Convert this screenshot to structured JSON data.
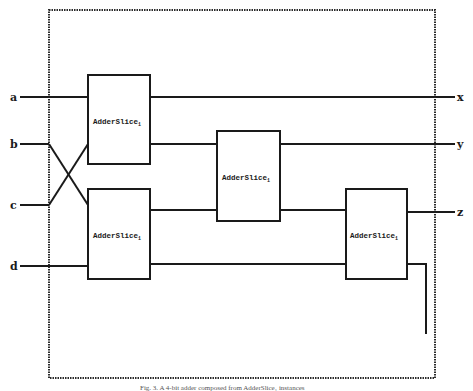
{
  "diagram": {
    "type": "circuit-block-diagram",
    "inputs": [
      {
        "label": "a",
        "y": 97
      },
      {
        "label": "b",
        "y": 144
      },
      {
        "label": "c",
        "y": 205
      },
      {
        "label": "d",
        "y": 266
      }
    ],
    "outputs": [
      {
        "label": "x",
        "y": 97
      },
      {
        "label": "y",
        "y": 144
      },
      {
        "label": "z",
        "y": 212
      }
    ],
    "blocks": [
      {
        "id": "slice-top-left",
        "label": "AdderSlice",
        "subscript": "1"
      },
      {
        "id": "slice-bottom-left",
        "label": "AdderSlice",
        "subscript": "1"
      },
      {
        "id": "slice-middle",
        "label": "AdderSlice",
        "subscript": "1"
      },
      {
        "id": "slice-right",
        "label": "AdderSlice",
        "subscript": "1"
      }
    ],
    "caption": "Fig. 3. A 4-bit adder composed from AdderSlice₁ instances"
  }
}
